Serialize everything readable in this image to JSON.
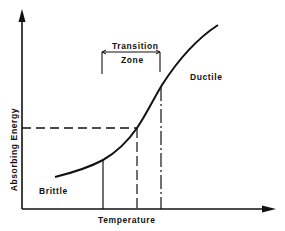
{
  "diagram": {
    "title": "",
    "axes": {
      "x_label": "Temperature",
      "y_label": "Absorbing Energy"
    },
    "regions": {
      "low": "Brittle",
      "high": "Ductile"
    },
    "transition": {
      "line1": "Transition",
      "line2": "Zone"
    },
    "colors": {
      "ink": "#111111",
      "background": "#ffffff"
    },
    "geometry": {
      "curve": [
        [
          55,
          177
        ],
        [
          80,
          170
        ],
        [
          103,
          160
        ],
        [
          122,
          145
        ],
        [
          137,
          128
        ],
        [
          150,
          107
        ],
        [
          162,
          85
        ],
        [
          180,
          60
        ],
        [
          200,
          40
        ],
        [
          218,
          25
        ]
      ],
      "reference_lines": {
        "horizontal_dashed_y": 128,
        "vertical_solid_x": 103,
        "vertical_dashed_x": 137,
        "vertical_dashdot_x": 161
      },
      "transition_bracket": {
        "x_start": 102,
        "x_end": 160,
        "y": 52
      }
    }
  }
}
